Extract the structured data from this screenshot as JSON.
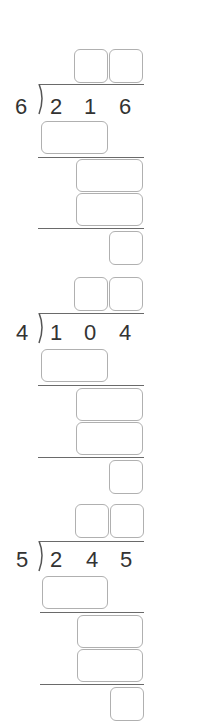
{
  "problems": [
    {
      "divisor": "6",
      "dividend_digits": [
        "2",
        "1",
        "6"
      ],
      "quotient_boxes": 2,
      "work_boxes": [
        "",
        "",
        "",
        ""
      ],
      "answer": ""
    },
    {
      "divisor": "4",
      "dividend_digits": [
        "1",
        "0",
        "4"
      ],
      "quotient_boxes": 2,
      "work_boxes": [
        "",
        "",
        "",
        ""
      ],
      "answer": ""
    },
    {
      "divisor": "5",
      "dividend_digits": [
        "2",
        "4",
        "5"
      ],
      "quotient_boxes": 2,
      "work_boxes": [
        "",
        "",
        "",
        ""
      ],
      "answer": ""
    }
  ],
  "colors": {
    "box_border": "#b0b0b0",
    "rule_line": "#6a6a6a",
    "digit": "#333333"
  }
}
